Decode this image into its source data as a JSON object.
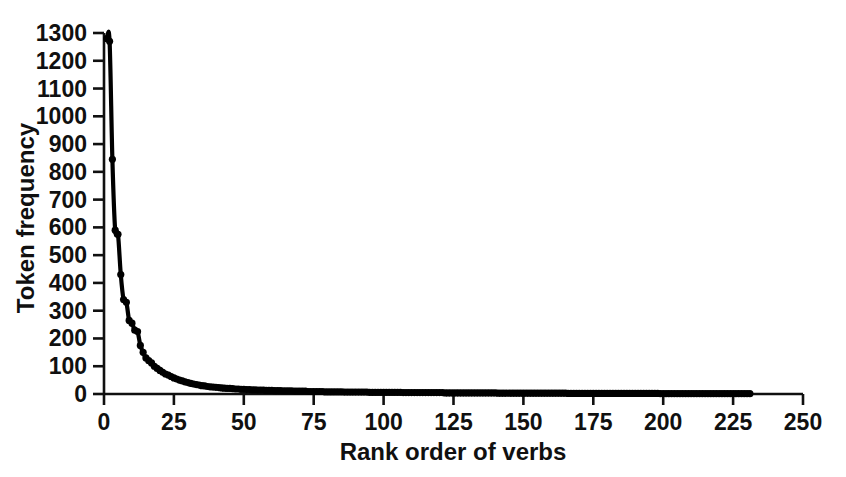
{
  "chart_data": {
    "type": "scatter",
    "title": "",
    "subtitle": "",
    "xlabel": "Rank order of verbs",
    "ylabel": "Token frequency",
    "xlim": [
      0,
      250
    ],
    "ylim": [
      0,
      1300
    ],
    "xticks": [
      0,
      25,
      50,
      75,
      100,
      125,
      150,
      175,
      200,
      225,
      250
    ],
    "xtick_labels": [
      "0",
      "25",
      "50",
      "75",
      "100",
      "125",
      "150",
      "175",
      "200",
      "225",
      "250"
    ],
    "yticks": [
      0,
      100,
      200,
      300,
      400,
      500,
      600,
      700,
      800,
      900,
      1000,
      1100,
      1200,
      1300
    ],
    "ytick_labels": [
      "0",
      "100",
      "200",
      "300",
      "400",
      "500",
      "600",
      "700",
      "800",
      "900",
      "1000",
      "1100",
      "1200",
      "1300"
    ],
    "grid": false,
    "legend": null,
    "legend_position": "none",
    "annotations": [],
    "marker": "filled-circle",
    "marker_color": "#000000",
    "line_color": "#000000",
    "has_fitted_curve": true,
    "fitted_curve_note": "smooth power-law / Zipf fit overlaid on points",
    "n_points": 231,
    "x": [
      1,
      2,
      3,
      4,
      5,
      6,
      7,
      8,
      9,
      10,
      11,
      12,
      13,
      14,
      15,
      16,
      17,
      18,
      19,
      20,
      21,
      22,
      23,
      24,
      25,
      26,
      27,
      28,
      29,
      30,
      31,
      32,
      33,
      34,
      35,
      36,
      37,
      38,
      39,
      40,
      41,
      42,
      43,
      44,
      45,
      46,
      47,
      48,
      49,
      50,
      51,
      52,
      53,
      54,
      55,
      56,
      57,
      58,
      59,
      60,
      61,
      62,
      63,
      64,
      65,
      66,
      67,
      68,
      69,
      70,
      71,
      72,
      73,
      74,
      75,
      76,
      77,
      78,
      79,
      80,
      81,
      82,
      83,
      84,
      85,
      86,
      87,
      88,
      89,
      90,
      91,
      92,
      93,
      94,
      95,
      96,
      97,
      98,
      99,
      100,
      101,
      102,
      103,
      104,
      105,
      106,
      107,
      108,
      109,
      110,
      111,
      112,
      113,
      114,
      115,
      116,
      117,
      118,
      119,
      120,
      121,
      122,
      123,
      124,
      125,
      126,
      127,
      128,
      129,
      130,
      131,
      132,
      133,
      134,
      135,
      136,
      137,
      138,
      139,
      140,
      141,
      142,
      143,
      144,
      145,
      146,
      147,
      148,
      149,
      150,
      151,
      152,
      153,
      154,
      155,
      156,
      157,
      158,
      159,
      160,
      161,
      162,
      163,
      164,
      165,
      166,
      167,
      168,
      169,
      170,
      171,
      172,
      173,
      174,
      175,
      176,
      177,
      178,
      179,
      180,
      181,
      182,
      183,
      184,
      185,
      186,
      187,
      188,
      189,
      190,
      191,
      192,
      193,
      194,
      195,
      196,
      197,
      198,
      199,
      200,
      201,
      202,
      203,
      204,
      205,
      206,
      207,
      208,
      209,
      210,
      211,
      212,
      213,
      214,
      215,
      216,
      217,
      218,
      219,
      220,
      221,
      222,
      223,
      224,
      225,
      226,
      227,
      228,
      229,
      230,
      231
    ],
    "y": [
      1280,
      1270,
      845,
      590,
      575,
      430,
      340,
      330,
      265,
      255,
      230,
      225,
      175,
      150,
      130,
      120,
      112,
      100,
      92,
      85,
      78,
      72,
      68,
      63,
      58,
      54,
      50,
      47,
      44,
      41,
      38,
      36,
      34,
      32,
      30,
      29,
      27,
      26,
      25,
      24,
      23,
      22,
      21,
      20,
      20,
      19,
      18,
      18,
      17,
      17,
      16,
      16,
      15,
      15,
      14,
      14,
      14,
      13,
      13,
      13,
      12,
      12,
      12,
      11,
      11,
      11,
      11,
      10,
      10,
      10,
      10,
      10,
      9,
      9,
      9,
      9,
      9,
      9,
      8,
      8,
      8,
      8,
      8,
      8,
      8,
      7,
      7,
      7,
      7,
      7,
      7,
      7,
      7,
      7,
      6,
      6,
      6,
      6,
      6,
      6,
      6,
      6,
      6,
      6,
      6,
      6,
      5,
      5,
      5,
      5,
      5,
      5,
      5,
      5,
      5,
      5,
      5,
      5,
      5,
      5,
      5,
      4,
      4,
      4,
      4,
      4,
      4,
      4,
      4,
      4,
      4,
      4,
      4,
      4,
      4,
      4,
      4,
      4,
      4,
      4,
      3,
      3,
      3,
      3,
      3,
      3,
      3,
      3,
      3,
      3,
      3,
      3,
      3,
      3,
      3,
      3,
      3,
      3,
      3,
      3,
      3,
      3,
      3,
      3,
      3,
      2,
      2,
      2,
      2,
      2,
      2,
      2,
      2,
      2,
      2,
      2,
      2,
      2,
      2,
      2,
      2,
      2,
      2,
      2,
      2,
      2,
      2,
      2,
      2,
      2,
      2,
      2,
      2,
      2,
      2,
      2,
      2,
      2,
      1,
      1,
      1,
      1,
      1,
      1,
      1,
      1,
      1,
      1,
      1,
      1,
      1,
      1,
      1,
      1,
      1,
      1,
      1,
      1,
      1,
      1,
      1,
      1,
      1,
      1,
      1,
      1,
      1,
      1,
      1,
      1,
      1
    ]
  },
  "style": {
    "background": "#ffffff",
    "ink": "#000000",
    "axis_color": "#101010"
  }
}
